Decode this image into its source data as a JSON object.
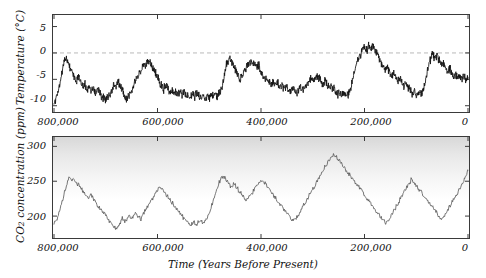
{
  "chart_data": [
    {
      "type": "line",
      "id": "temperature",
      "title": "",
      "xlabel": "Time (Years Before Present)",
      "ylabel": "Temperature (°C)",
      "xlim": [
        800000,
        0
      ],
      "ylim": [
        -11,
        7
      ],
      "xticks": [
        800000,
        600000,
        400000,
        200000,
        0
      ],
      "xticklabels": [
        "800,000",
        "600,000",
        "400,000",
        "200,000",
        "0"
      ],
      "yticks": [
        5,
        0,
        -5,
        -10
      ],
      "yticklabels": [
        "5",
        "0",
        "-5",
        "-10"
      ],
      "grid": false,
      "legend": null,
      "reference_line": {
        "y": 0,
        "style": "dashed",
        "color": "#b9b9b9"
      },
      "line_color": "#111111",
      "x": [
        800000,
        796000,
        792000,
        788000,
        784000,
        780000,
        776000,
        772000,
        768000,
        764000,
        760000,
        756000,
        752000,
        748000,
        744000,
        740000,
        736000,
        732000,
        728000,
        724000,
        720000,
        716000,
        712000,
        708000,
        704000,
        700000,
        696000,
        692000,
        688000,
        684000,
        680000,
        676000,
        672000,
        668000,
        664000,
        660000,
        656000,
        652000,
        648000,
        644000,
        640000,
        636000,
        632000,
        628000,
        624000,
        620000,
        616000,
        612000,
        608000,
        604000,
        600000,
        596000,
        592000,
        588000,
        584000,
        580000,
        576000,
        572000,
        568000,
        564000,
        560000,
        556000,
        552000,
        548000,
        544000,
        540000,
        536000,
        532000,
        528000,
        524000,
        520000,
        516000,
        512000,
        508000,
        504000,
        500000,
        496000,
        492000,
        488000,
        484000,
        480000,
        476000,
        472000,
        468000,
        464000,
        460000,
        456000,
        452000,
        448000,
        444000,
        440000,
        436000,
        432000,
        428000,
        424000,
        420000,
        416000,
        412000,
        408000,
        404000,
        400000,
        396000,
        392000,
        388000,
        384000,
        380000,
        376000,
        372000,
        368000,
        364000,
        360000,
        356000,
        352000,
        348000,
        344000,
        340000,
        336000,
        332000,
        328000,
        324000,
        320000,
        316000,
        312000,
        308000,
        304000,
        300000,
        296000,
        292000,
        288000,
        284000,
        280000,
        276000,
        272000,
        268000,
        264000,
        260000,
        256000,
        252000,
        248000,
        244000,
        240000,
        236000,
        232000,
        228000,
        224000,
        220000,
        216000,
        212000,
        208000,
        204000,
        200000,
        196000,
        192000,
        188000,
        184000,
        180000,
        176000,
        172000,
        168000,
        164000,
        160000,
        156000,
        152000,
        148000,
        144000,
        140000,
        136000,
        132000,
        128000,
        124000,
        120000,
        116000,
        112000,
        108000,
        104000,
        100000,
        96000,
        92000,
        88000,
        84000,
        80000,
        76000,
        72000,
        68000,
        64000,
        60000,
        56000,
        52000,
        48000,
        44000,
        40000,
        36000,
        32000,
        28000,
        24000,
        20000,
        16000,
        12000,
        8000,
        4000,
        0
      ],
      "values": [
        -9.2,
        -8.6,
        -7.4,
        -5.2,
        -3.4,
        -1.2,
        -0.6,
        -1.8,
        -3.2,
        -4.0,
        -4.6,
        -5.2,
        -4.4,
        -5.6,
        -6.8,
        -5.8,
        -7.2,
        -6.2,
        -7.6,
        -6.4,
        -7.8,
        -6.6,
        -7.4,
        -8.6,
        -8.2,
        -8.8,
        -8.4,
        -8.0,
        -7.2,
        -5.8,
        -6.6,
        -5.4,
        -6.2,
        -7.0,
        -8.2,
        -8.8,
        -8.4,
        -7.6,
        -6.4,
        -5.4,
        -4.6,
        -4.0,
        -3.4,
        -2.8,
        -2.4,
        -2.0,
        -1.6,
        -2.2,
        -3.0,
        -3.8,
        -4.6,
        -5.4,
        -6.2,
        -6.8,
        -6.2,
        -6.8,
        -7.4,
        -7.0,
        -7.6,
        -7.2,
        -7.8,
        -7.4,
        -8.0,
        -7.6,
        -8.2,
        -7.8,
        -8.4,
        -7.8,
        -8.2,
        -7.6,
        -8.0,
        -8.4,
        -8.0,
        -8.6,
        -8.2,
        -8.6,
        -8.0,
        -8.4,
        -7.8,
        -8.2,
        -7.6,
        -7.0,
        -4.6,
        -2.6,
        -1.6,
        -1.2,
        -1.8,
        -2.6,
        -3.4,
        -4.2,
        -5.0,
        -4.2,
        -3.4,
        -2.8,
        -2.2,
        -1.4,
        -2.2,
        -1.6,
        -2.8,
        -2.2,
        -3.6,
        -4.4,
        -5.2,
        -4.6,
        -5.4,
        -6.0,
        -5.4,
        -6.2,
        -5.6,
        -6.4,
        -6.0,
        -6.6,
        -6.2,
        -6.8,
        -7.2,
        -6.6,
        -7.0,
        -7.6,
        -7.2,
        -6.6,
        -7.2,
        -6.6,
        -6.0,
        -5.4,
        -4.8,
        -5.4,
        -4.8,
        -4.2,
        -4.8,
        -5.4,
        -6.0,
        -5.4,
        -6.0,
        -6.6,
        -6.2,
        -6.8,
        -7.2,
        -7.8,
        -7.4,
        -8.0,
        -7.6,
        -8.2,
        -7.8,
        -7.2,
        -5.6,
        -3.6,
        -2.0,
        -1.0,
        -0.2,
        0.6,
        1.2,
        0.4,
        1.4,
        0.6,
        1.6,
        0.8,
        -0.2,
        -1.0,
        -1.8,
        -2.6,
        -3.4,
        -2.8,
        -3.6,
        -4.4,
        -3.8,
        -4.6,
        -5.4,
        -4.8,
        -5.6,
        -6.2,
        -5.6,
        -6.4,
        -7.0,
        -7.6,
        -7.2,
        -7.8,
        -7.4,
        -8.0,
        -7.4,
        -6.2,
        -4.4,
        -2.4,
        -1.0,
        -0.2,
        -1.2,
        -0.4,
        -1.4,
        -2.4,
        -1.6,
        -2.6,
        -3.6,
        -2.8,
        -3.8,
        -4.6,
        -4.0,
        -4.8,
        -4.2,
        -5.0,
        -4.4,
        -5.2,
        -4.6,
        -5.4,
        -6.0,
        -5.4,
        -6.2,
        -5.6,
        -6.4,
        -5.8,
        -6.6,
        -5.8,
        -5.0,
        -4.2,
        -3.4,
        -2.6,
        -2.0,
        -2.8,
        -2.2,
        -3.0,
        -2.4,
        -3.2,
        -4.0,
        -3.4,
        -4.2,
        -5.0,
        -4.4,
        -5.2,
        -6.0,
        -5.4,
        -6.2,
        -7.0,
        -6.4,
        -7.2,
        -6.6,
        -7.4,
        -6.8,
        -7.6,
        -7.0,
        -7.8,
        -7.2,
        -6.0,
        -3.8,
        -1.6,
        0.6,
        2.2,
        3.6,
        4.4,
        3.6,
        4.2,
        3.4,
        2.6,
        1.8,
        1.2,
        0.4,
        -0.4,
        0.2,
        -0.6,
        -1.4,
        -0.8,
        -1.6,
        -1.0,
        -1.8,
        -2.6,
        -2.0,
        -2.8,
        -2.2,
        -3.0,
        -2.4,
        -3.2,
        -4.0,
        -3.4,
        -4.2,
        -3.6,
        -4.4,
        -5.2,
        -4.6,
        -5.4,
        -4.8,
        -5.6,
        -6.4,
        -5.8,
        -6.6,
        -6.0,
        -6.8,
        -6.2,
        -7.0,
        -6.4,
        -7.2,
        -6.6,
        -7.4,
        -6.8,
        -7.6,
        -7.0,
        -7.8,
        -7.2,
        -8.0,
        -7.4,
        -8.2,
        -7.6,
        -8.4,
        -7.8,
        -8.6,
        -8.0,
        -8.8,
        -8.2,
        -8.6,
        -8.0,
        -7.0,
        -5.2,
        -3.2,
        -1.6,
        -0.6,
        0.2,
        0.6,
        0.4,
        0.6,
        0.2,
        0.4
      ]
    },
    {
      "type": "line",
      "id": "co2",
      "title": "",
      "xlabel": "Time (Years Before Present)",
      "ylabel": "CO2 concentration (ppm)",
      "ylabel_parts": {
        "pre": "CO",
        "sub": "2",
        "post": " concentration (ppm)"
      },
      "xlim": [
        800000,
        0
      ],
      "ylim": [
        170,
        312
      ],
      "xticks": [
        800000,
        600000,
        400000,
        200000,
        0
      ],
      "xticklabels": [
        "800,000",
        "600,000",
        "400,000",
        "200,000",
        "0"
      ],
      "yticks": [
        300,
        250,
        200
      ],
      "yticklabels": [
        "300",
        "250",
        "200"
      ],
      "grid": false,
      "legend": null,
      "line_color": "#555555",
      "x": [
        800000,
        794000,
        788000,
        782000,
        776000,
        770000,
        764000,
        758000,
        752000,
        746000,
        740000,
        734000,
        728000,
        722000,
        716000,
        710000,
        704000,
        698000,
        692000,
        686000,
        680000,
        674000,
        668000,
        662000,
        656000,
        650000,
        644000,
        638000,
        632000,
        626000,
        620000,
        614000,
        608000,
        602000,
        596000,
        590000,
        584000,
        578000,
        572000,
        566000,
        560000,
        554000,
        548000,
        542000,
        536000,
        530000,
        524000,
        518000,
        512000,
        506000,
        500000,
        494000,
        488000,
        482000,
        476000,
        470000,
        464000,
        458000,
        452000,
        446000,
        440000,
        434000,
        428000,
        422000,
        416000,
        410000,
        404000,
        398000,
        392000,
        386000,
        380000,
        374000,
        368000,
        362000,
        356000,
        350000,
        344000,
        338000,
        332000,
        326000,
        320000,
        314000,
        308000,
        302000,
        296000,
        290000,
        284000,
        278000,
        272000,
        266000,
        260000,
        254000,
        248000,
        242000,
        236000,
        230000,
        224000,
        218000,
        212000,
        206000,
        200000,
        194000,
        188000,
        182000,
        176000,
        170000,
        164000,
        158000,
        152000,
        146000,
        140000,
        134000,
        128000,
        122000,
        116000,
        110000,
        104000,
        98000,
        92000,
        86000,
        80000,
        74000,
        68000,
        62000,
        56000,
        50000,
        44000,
        38000,
        32000,
        26000,
        20000,
        14000,
        8000,
        4000,
        0
      ],
      "values": [
        190,
        196,
        210,
        228,
        244,
        256,
        252,
        248,
        244,
        238,
        232,
        226,
        230,
        222,
        216,
        210,
        204,
        198,
        192,
        186,
        182,
        188,
        196,
        192,
        200,
        196,
        204,
        200,
        196,
        204,
        212,
        220,
        228,
        236,
        242,
        238,
        232,
        226,
        220,
        214,
        208,
        202,
        196,
        190,
        186,
        192,
        188,
        194,
        190,
        196,
        204,
        218,
        232,
        246,
        258,
        254,
        248,
        242,
        246,
        240,
        234,
        228,
        222,
        228,
        234,
        240,
        246,
        252,
        246,
        240,
        234,
        228,
        222,
        216,
        210,
        204,
        198,
        192,
        196,
        204,
        212,
        220,
        228,
        236,
        244,
        252,
        260,
        268,
        276,
        284,
        288,
        284,
        278,
        272,
        266,
        260,
        254,
        248,
        242,
        236,
        230,
        224,
        218,
        212,
        206,
        200,
        194,
        190,
        196,
        204,
        212,
        220,
        228,
        236,
        244,
        252,
        248,
        242,
        236,
        230,
        224,
        218,
        212,
        206,
        200,
        196,
        202,
        210,
        218,
        226,
        234,
        242,
        250,
        258,
        266,
        272,
        278,
        274,
        268,
        262,
        256,
        250,
        244,
        238,
        232,
        226,
        220,
        214,
        208,
        202,
        196,
        192,
        188,
        184,
        190,
        198,
        206,
        214,
        222,
        230,
        238,
        246,
        254,
        262,
        270,
        278,
        286,
        292,
        288,
        282,
        276,
        270,
        264,
        258,
        252,
        246,
        240,
        234,
        228,
        222,
        216,
        210,
        204,
        198,
        194,
        190,
        196,
        204,
        212,
        220,
        228,
        236,
        244,
        252,
        248,
        242,
        236,
        230,
        224,
        218,
        212,
        206,
        200,
        196,
        192,
        188,
        184,
        180,
        186,
        194,
        204,
        214,
        224,
        234,
        244,
        254,
        264,
        272,
        278,
        282,
        284,
        280,
        276,
        272,
        268,
        264,
        260,
        256,
        252,
        248,
        244,
        240,
        236,
        232,
        228,
        224,
        220,
        216,
        212,
        208,
        204,
        200,
        196,
        192,
        188,
        184,
        182,
        180,
        178,
        182,
        190,
        200,
        212,
        224,
        236,
        248,
        258,
        266,
        272,
        276,
        280,
        282,
        284,
        286,
        288,
        290,
        292,
        294,
        296,
        298,
        300
      ]
    }
  ],
  "axes": {
    "temperature": {
      "ylabel": "Temperature (°C)",
      "yticklabels": [
        "5",
        "0",
        "-5",
        "-10"
      ],
      "xticklabels": [
        "800,000",
        "600,000",
        "400,000",
        "200,000",
        "0"
      ]
    },
    "co2": {
      "ylabel_pre": "CO",
      "ylabel_sub": "2",
      "ylabel_post": " concentration (ppm)",
      "yticklabels": [
        "300",
        "250",
        "200"
      ],
      "xticklabels": [
        "800,000",
        "600,000",
        "400,000",
        "200,000",
        "0"
      ]
    },
    "xaxis_title": "Time (Years Before Present)"
  }
}
